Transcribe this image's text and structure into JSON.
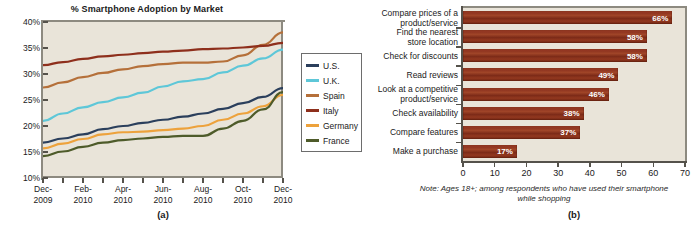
{
  "figure_a": {
    "caption": "(a)",
    "title": "% Smartphone Adoption by Market",
    "legend": [
      {
        "label": "U.S.",
        "color": "#2b3f5c"
      },
      {
        "label": "U.K.",
        "color": "#5ec7d8"
      },
      {
        "label": "Spain",
        "color": "#b5703a"
      },
      {
        "label": "Italy",
        "color": "#8e2f1c"
      },
      {
        "label": "Germany",
        "color": "#eda23c"
      },
      {
        "label": "France",
        "color": "#4e5b2a"
      }
    ]
  },
  "figure_b": {
    "caption": "(b)",
    "note": "Note: Ages 18+; among respondents who have used their smartphone while shopping"
  },
  "chart_data": [
    {
      "type": "line",
      "title": "% Smartphone Adoption by Market",
      "xlabel": "",
      "ylabel": "",
      "ylim": [
        10,
        40
      ],
      "yticks": [
        "10%",
        "15%",
        "20%",
        "25%",
        "30%",
        "35%",
        "40%"
      ],
      "grid": false,
      "legend_position": "right",
      "x": [
        "Dec-\n2009",
        "Feb-\n2010",
        "Apr-\n2010",
        "Jun-\n2010",
        "Aug-\n2010",
        "Oct-\n2010",
        "Dec-\n2010"
      ],
      "x_dense": [
        "Dec-2009",
        "Jan-2010",
        "Feb-2010",
        "Mar-2010",
        "Apr-2010",
        "May-2010",
        "Jun-2010",
        "Jul-2010",
        "Aug-2010",
        "Sep-2010",
        "Oct-2010",
        "Nov-2010",
        "Dec-2010"
      ],
      "series": [
        {
          "name": "U.S.",
          "color": "#2b3f5c",
          "values": [
            16.8,
            17.6,
            18.4,
            19.4,
            20.0,
            20.6,
            21.2,
            21.8,
            22.4,
            23.3,
            24.4,
            25.6,
            27.3
          ]
        },
        {
          "name": "U.K.",
          "color": "#5ec7d8",
          "values": [
            21.0,
            22.4,
            23.6,
            24.6,
            25.5,
            26.4,
            27.6,
            28.6,
            29.0,
            30.3,
            31.6,
            33.0,
            34.7
          ]
        },
        {
          "name": "Spain",
          "color": "#b5703a",
          "values": [
            27.4,
            28.4,
            29.4,
            30.2,
            30.9,
            31.5,
            31.9,
            32.2,
            32.2,
            32.4,
            33.6,
            35.6,
            38.0
          ]
        },
        {
          "name": "Italy",
          "color": "#8e2f1c",
          "values": [
            31.7,
            32.3,
            32.9,
            33.4,
            33.7,
            34.0,
            34.3,
            34.5,
            34.8,
            34.9,
            35.1,
            35.4,
            36.0
          ]
        },
        {
          "name": "Germany",
          "color": "#eda23c",
          "values": [
            15.7,
            16.6,
            17.5,
            18.4,
            18.8,
            18.9,
            19.2,
            19.5,
            20.0,
            21.2,
            22.4,
            23.8,
            26.0
          ]
        },
        {
          "name": "France",
          "color": "#4e5b2a",
          "values": [
            14.2,
            15.1,
            16.0,
            16.8,
            17.3,
            17.6,
            17.9,
            18.1,
            18.1,
            19.5,
            21.0,
            23.2,
            26.5
          ]
        }
      ]
    },
    {
      "type": "bar",
      "orientation": "horizontal",
      "title": "",
      "xlabel": "",
      "ylabel": "",
      "xlim": [
        0,
        70
      ],
      "xticks": [
        "0",
        "10",
        "20",
        "30",
        "40",
        "50",
        "60",
        "70"
      ],
      "grid": false,
      "bar_color": "#8f3420",
      "categories": [
        "Compare prices of a\nproduct/service",
        "Find the nearest\nstore location",
        "Check for discounts",
        "Read reviews",
        "Look at a competitive\nproduct/service",
        "Check availability",
        "Compare features",
        "Make a purchase"
      ],
      "values": [
        66,
        58,
        58,
        49,
        46,
        38,
        37,
        17
      ],
      "data_labels": [
        "66%",
        "58%",
        "58%",
        "49%",
        "46%",
        "38%",
        "37%",
        "17%"
      ],
      "note": "Note: Ages 18+; among respondents who have used their smartphone while shopping"
    }
  ]
}
